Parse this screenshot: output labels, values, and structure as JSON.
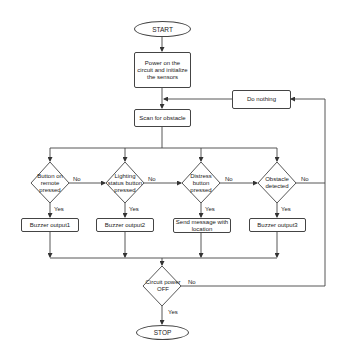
{
  "flowchart": {
    "start": "START",
    "init": "Power on the circuit and initialize the sensors",
    "do_nothing": "Do nothing",
    "scan": "Scan for obstacle",
    "decisions": [
      {
        "label": "Button on remote pressed",
        "yes": "Yes",
        "no": "No",
        "action": "Buzzer output1"
      },
      {
        "label": "Lighting status button pressed",
        "yes": "Yes",
        "no": "No",
        "action": "Buzzer output2"
      },
      {
        "label": "Distress button pressed",
        "yes": "Yes",
        "no": "No",
        "action": "Send message with location"
      },
      {
        "label": "Obstacle detected",
        "yes": "Yes",
        "no": "No",
        "action": "Buzzer output3"
      }
    ],
    "power_check": {
      "label": "Circuit power OFF",
      "yes": "Yes",
      "no": "No"
    },
    "stop": "STOP"
  },
  "colors": {
    "line": "#444444",
    "background": "#ffffff",
    "text": "#222222"
  }
}
